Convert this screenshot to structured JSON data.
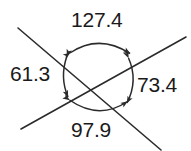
{
  "figure": {
    "type": "geometry-diagram",
    "stroke_color": "#2b2b2b",
    "text_color": "#1a1a1a",
    "background_color": "#ffffff",
    "labels": {
      "top": "127.4",
      "left": "61.3",
      "right": "73.4",
      "bottom": "97.9"
    },
    "lines": [
      {
        "name": "line-upper-left-to-lower-right",
        "x1": 18,
        "y1": 28,
        "x2": 161,
        "y2": 150
      },
      {
        "name": "line-lower-left-to-upper-right",
        "x1": 21,
        "y1": 129,
        "x2": 186,
        "y2": 37
      }
    ],
    "intersection": {
      "x": 98,
      "y": 78
    },
    "arcs": [
      {
        "name": "arc-top",
        "d": "M 69 54 Q 99 33 131 54"
      },
      {
        "name": "arc-left",
        "d": "M 66 56 Q 58 77 67 98"
      },
      {
        "name": "arc-right",
        "d": "M 129 58 Q 139 80 127 104"
      },
      {
        "name": "arc-bottom",
        "d": "M 69 101 Q 99 121 128 102"
      }
    ]
  }
}
